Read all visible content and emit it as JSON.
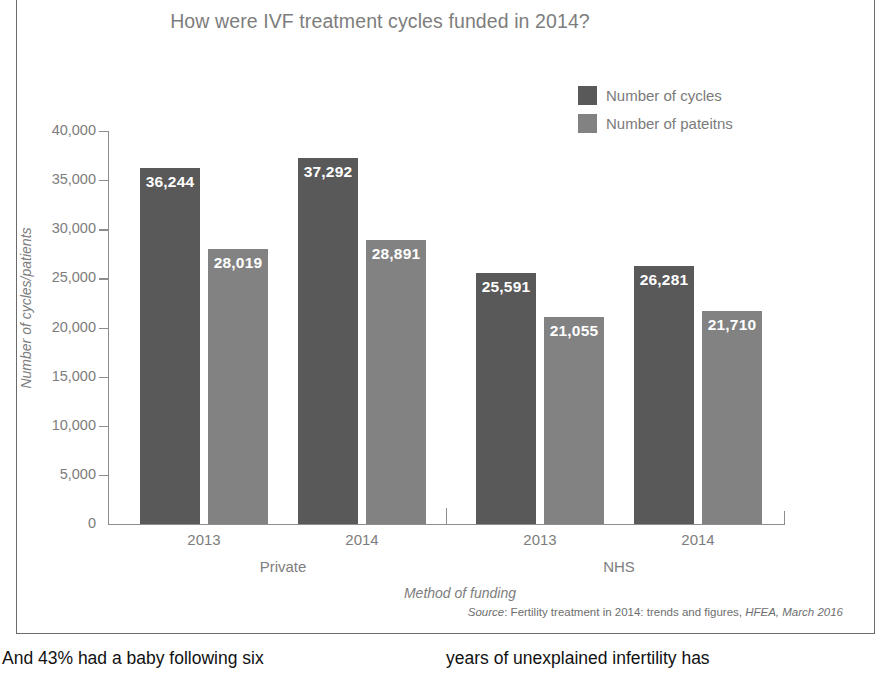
{
  "figure": {
    "title": "How were IVF treatment cycles funded in 2014?",
    "source_prefix": "Source",
    "source_sep": ": ",
    "source_main": "Fertility treatment in 2014: trends and figures, ",
    "source_italic": "HFEA, March 2016"
  },
  "legend": {
    "items": [
      {
        "label": "Number of cycles",
        "color": "#595959"
      },
      {
        "label": "Number of pateitns",
        "color": "#828282"
      }
    ]
  },
  "axes": {
    "y_title": "Number of cycles/patients",
    "x_title": "Method of funding",
    "y_ticks": [
      "40,000",
      "35,000",
      "30,000",
      "25,000",
      "20,000",
      "15,000",
      "10,000",
      "5,000",
      "0"
    ],
    "x_tick_labels": [
      "2013",
      "2014",
      "2013",
      "2014"
    ],
    "x_group_labels": [
      "Private",
      "NHS"
    ]
  },
  "bars": [
    {
      "value_label": "36,244",
      "value": 36244,
      "color": "#595959",
      "left": 32,
      "width": 60
    },
    {
      "value_label": "28,019",
      "value": 28019,
      "color": "#828282",
      "left": 100,
      "width": 60
    },
    {
      "value_label": "37,292",
      "value": 37292,
      "color": "#595959",
      "left": 190,
      "width": 60
    },
    {
      "value_label": "28,891",
      "value": 28891,
      "color": "#828282",
      "left": 258,
      "width": 60
    },
    {
      "value_label": "25,591",
      "value": 25591,
      "color": "#595959",
      "left": 368,
      "width": 60
    },
    {
      "value_label": "21,055",
      "value": 21055,
      "color": "#828282",
      "left": 436,
      "width": 60
    },
    {
      "value_label": "26,281",
      "value": 26281,
      "color": "#595959",
      "left": 526,
      "width": 60
    },
    {
      "value_label": "21,710",
      "value": 21710,
      "color": "#828282",
      "left": 594,
      "width": 60
    }
  ],
  "body_text": {
    "left_column": "And 43% had a baby following six",
    "right_column": "years of unexplained infertility has"
  },
  "chart_data": {
    "type": "bar",
    "title": "How were IVF treatment cycles funded in 2014?",
    "xlabel": "Method of funding",
    "ylabel": "Number of cycles/patients",
    "ylim": [
      0,
      40000
    ],
    "ytick_interval": 5000,
    "grid": false,
    "legend_position": "top-right",
    "groups": [
      "Private",
      "NHS"
    ],
    "categories": [
      "Private 2013",
      "Private 2014",
      "NHS 2013",
      "NHS 2014"
    ],
    "series": [
      {
        "name": "Number of cycles",
        "color": "#595959",
        "values": [
          36244,
          37292,
          25591,
          26281
        ]
      },
      {
        "name": "Number of pateitns",
        "color": "#828282",
        "values": [
          28019,
          28891,
          21055,
          21710
        ]
      }
    ],
    "source": "Source: Fertility treatment in 2014: trends and figures, HFEA, March 2016"
  }
}
